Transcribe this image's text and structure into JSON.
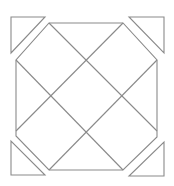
{
  "diagram": {
    "stroke_color": "#8a8a8a",
    "background": "#ffffff",
    "octagon": [
      [
        49,
        23
      ],
      [
        123,
        23
      ],
      [
        157,
        60
      ],
      [
        157,
        137
      ],
      [
        123,
        170
      ],
      [
        49,
        170
      ],
      [
        16,
        136
      ],
      [
        16,
        60
      ]
    ],
    "diagonals": [
      [
        [
          49,
          23
        ],
        [
          157,
          131
        ]
      ],
      [
        [
          16,
          60
        ],
        [
          123,
          170
        ]
      ],
      [
        [
          123,
          23
        ],
        [
          16,
          131
        ]
      ],
      [
        [
          157,
          60
        ],
        [
          49,
          170
        ]
      ]
    ],
    "corner_triangles": [
      [
        [
          11,
          17
        ],
        [
          45,
          17
        ],
        [
          11,
          53
        ]
      ],
      [
        [
          129,
          17
        ],
        [
          164,
          17
        ],
        [
          164,
          53
        ]
      ],
      [
        [
          11,
          141
        ],
        [
          11,
          175
        ],
        [
          45,
          175
        ]
      ],
      [
        [
          164,
          142
        ],
        [
          164,
          176
        ],
        [
          129,
          176
        ]
      ]
    ]
  }
}
